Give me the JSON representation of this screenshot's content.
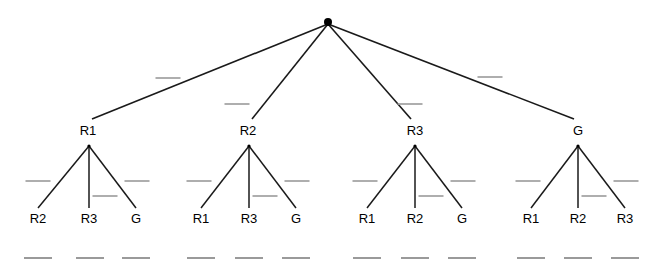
{
  "diagram": {
    "background_color": "#ffffff",
    "edge_color": "#1a1a1a",
    "node_color": "#000000",
    "mark_color": "#9a9a9a",
    "root": {
      "name": "root-node",
      "x": 328,
      "y": 22,
      "radius": 4
    },
    "internal_nodes": [
      {
        "label": "R1",
        "x": 88,
        "y": 130,
        "apex_x": 89,
        "apex_y": 146
      },
      {
        "label": "R2",
        "x": 248,
        "y": 130,
        "apex_x": 249,
        "apex_y": 146
      },
      {
        "label": "R3",
        "x": 415,
        "y": 130,
        "apex_x": 415,
        "apex_y": 146
      },
      {
        "label": "G",
        "x": 578,
        "y": 130,
        "apex_x": 578,
        "apex_y": 146
      }
    ],
    "leaves": [
      {
        "label": "R2",
        "x": 38,
        "y": 218,
        "parent": 0
      },
      {
        "label": "R3",
        "x": 89,
        "y": 218,
        "parent": 0
      },
      {
        "label": "G",
        "x": 136,
        "y": 218,
        "parent": 0
      },
      {
        "label": "R1",
        "x": 201,
        "y": 218,
        "parent": 1
      },
      {
        "label": "R3",
        "x": 249,
        "y": 218,
        "parent": 1
      },
      {
        "label": "G",
        "x": 296,
        "y": 218,
        "parent": 1
      },
      {
        "label": "R1",
        "x": 367,
        "y": 218,
        "parent": 2
      },
      {
        "label": "R2",
        "x": 415,
        "y": 218,
        "parent": 2
      },
      {
        "label": "G",
        "x": 462,
        "y": 218,
        "parent": 2
      },
      {
        "label": "R1",
        "x": 531,
        "y": 218,
        "parent": 3
      },
      {
        "label": "R2",
        "x": 578,
        "y": 218,
        "parent": 3
      },
      {
        "label": "R3",
        "x": 625,
        "y": 218,
        "parent": 3
      }
    ],
    "edge_marks": [
      {
        "x": 168,
        "y": 78,
        "width": 25
      },
      {
        "x": 237,
        "y": 104,
        "width": 25
      },
      {
        "x": 410,
        "y": 104,
        "width": 25
      },
      {
        "x": 490,
        "y": 77,
        "width": 25
      },
      {
        "x": 38,
        "y": 181,
        "width": 25
      },
      {
        "x": 105,
        "y": 196,
        "width": 25
      },
      {
        "x": 137,
        "y": 181,
        "width": 25
      },
      {
        "x": 199,
        "y": 181,
        "width": 25
      },
      {
        "x": 265,
        "y": 196,
        "width": 25
      },
      {
        "x": 297,
        "y": 181,
        "width": 25
      },
      {
        "x": 365,
        "y": 181,
        "width": 25
      },
      {
        "x": 431,
        "y": 196,
        "width": 25
      },
      {
        "x": 463,
        "y": 181,
        "width": 25
      },
      {
        "x": 528,
        "y": 181,
        "width": 25
      },
      {
        "x": 594,
        "y": 196,
        "width": 25
      },
      {
        "x": 626,
        "y": 181,
        "width": 25
      }
    ],
    "footer_marks": [
      {
        "x": 38,
        "y": 258,
        "width": 28
      },
      {
        "x": 90,
        "y": 258,
        "width": 28
      },
      {
        "x": 136,
        "y": 258,
        "width": 28
      },
      {
        "x": 201,
        "y": 258,
        "width": 28
      },
      {
        "x": 249,
        "y": 258,
        "width": 28
      },
      {
        "x": 296,
        "y": 258,
        "width": 28
      },
      {
        "x": 367,
        "y": 258,
        "width": 28
      },
      {
        "x": 415,
        "y": 258,
        "width": 28
      },
      {
        "x": 462,
        "y": 258,
        "width": 28
      },
      {
        "x": 531,
        "y": 258,
        "width": 28
      },
      {
        "x": 578,
        "y": 258,
        "width": 28
      },
      {
        "x": 625,
        "y": 258,
        "width": 28
      }
    ]
  }
}
